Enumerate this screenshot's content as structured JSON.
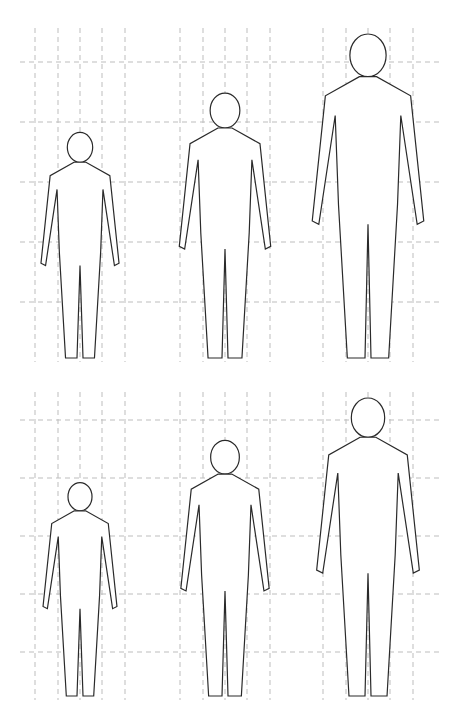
{
  "diagram": {
    "title": "",
    "rows": [
      {
        "name": "row-1",
        "figures": [
          {
            "stage": "child",
            "relative_height": 0.7
          },
          {
            "stage": "adolescent",
            "relative_height": 0.82
          },
          {
            "stage": "adult",
            "relative_height": 1.0
          }
        ]
      },
      {
        "name": "row-2",
        "figures": [
          {
            "stage": "child",
            "relative_height": 0.72
          },
          {
            "stage": "adolescent",
            "relative_height": 0.86
          },
          {
            "stage": "adult",
            "relative_height": 1.0
          }
        ]
      }
    ],
    "colors": {
      "line": "#2a2a2a",
      "grid": "#bdbdbd",
      "background": "#ffffff"
    }
  }
}
